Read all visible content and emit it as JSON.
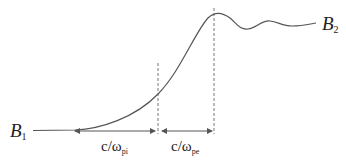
{
  "diagram": {
    "labels": {
      "left_field": {
        "main": "B",
        "sub": "1"
      },
      "right_field": {
        "main": "B",
        "sub": "2"
      },
      "ion_scale": {
        "main": "c/ω",
        "sub": "pi"
      },
      "electron_scale": {
        "main": "c/ω",
        "sub": "pe"
      }
    },
    "colors": {
      "curve": "#555555",
      "dashed": "#666666",
      "arrow": "#555555",
      "text": "#222222"
    }
  }
}
